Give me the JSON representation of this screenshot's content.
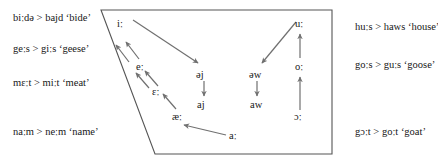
{
  "diagram": {
    "colors": {
      "outline": "#555555",
      "arrow": "#707070",
      "text": "#171717",
      "background": "#ffffff"
    },
    "examples_left": [
      {
        "id": "bide",
        "text": "biːdə > bajd ‘bide’"
      },
      {
        "id": "geese",
        "text": "geːs > giːs ‘geese’"
      },
      {
        "id": "meat",
        "text": "mɛːt > miːt ‘meat’"
      },
      {
        "id": "name",
        "text": "naːm > neːm ‘name’"
      }
    ],
    "examples_right": [
      {
        "id": "house",
        "text": "huːs > haws ‘house’"
      },
      {
        "id": "goose",
        "text": "goːs > guːs ‘goose’"
      },
      {
        "id": "goat",
        "text": "gɔːt > goːt ‘goat’"
      }
    ],
    "vowels": [
      {
        "id": "i-long",
        "symbol": "iː"
      },
      {
        "id": "e-long",
        "symbol": "eː"
      },
      {
        "id": "epsilon-long",
        "symbol": "ɛː"
      },
      {
        "id": "ae-long",
        "symbol": "æː"
      },
      {
        "id": "u-long",
        "symbol": "uː"
      },
      {
        "id": "o-long",
        "symbol": "oː"
      },
      {
        "id": "open-o-long",
        "symbol": "ɔː"
      },
      {
        "id": "a-long",
        "symbol": "aː"
      },
      {
        "id": "schwa-j",
        "symbol": "əj"
      },
      {
        "id": "aj",
        "symbol": "aj"
      },
      {
        "id": "schwa-w",
        "symbol": "əw"
      },
      {
        "id": "aw",
        "symbol": "aw"
      }
    ],
    "arrows": [
      {
        "id": "e-to-i",
        "from": "eː",
        "to": "iː"
      },
      {
        "id": "epsilon-to-e",
        "from": "ɛː",
        "to": "eː"
      },
      {
        "id": "ae-to-epsilon",
        "from": "æː",
        "to": "ɛː"
      },
      {
        "id": "a-to-ae",
        "from": "aː",
        "to": "æː"
      },
      {
        "id": "i-to-schwa-j",
        "from": "iː",
        "to": "əj"
      },
      {
        "id": "schwa-j-to-aj",
        "from": "əj",
        "to": "aj"
      },
      {
        "id": "o-to-u",
        "from": "oː",
        "to": "uː"
      },
      {
        "id": "open-o-to-o",
        "from": "ɔː",
        "to": "oː"
      },
      {
        "id": "u-to-schwa-w",
        "from": "uː",
        "to": "əw"
      },
      {
        "id": "schwa-w-to-aw",
        "from": "əw",
        "to": "aw"
      }
    ]
  }
}
